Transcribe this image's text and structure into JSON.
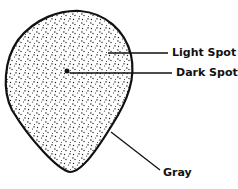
{
  "diagram": {
    "labels": {
      "light_spot": "Light Spot",
      "dark_spot": "Dark Spot",
      "gray": "Gray"
    },
    "colors": {
      "outline": "#111111",
      "speckle": "#222222",
      "background": "#ffffff"
    }
  }
}
